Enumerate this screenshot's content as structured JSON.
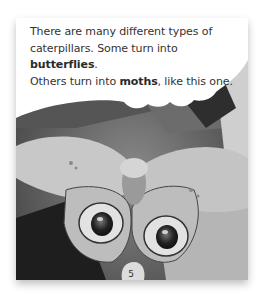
{
  "page": {
    "text": {
      "line1": "There are many different types of",
      "line2_pre": "caterpillars. Some turn into ",
      "line2_bold": "butterflies",
      "line2_post": ".",
      "line3_pre": "Others turn into ",
      "line3_bold": "moths",
      "line3_post": ", like this one."
    },
    "page_number": "5",
    "image": "moth-eyespots-photo"
  }
}
